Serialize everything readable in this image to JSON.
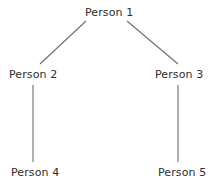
{
  "diagram": {
    "background_color": "#ffffff",
    "line_color": "#6e6e72",
    "text_color": "#2e2e2e",
    "nodes": [
      {
        "id": "person-1",
        "label": "Person 1"
      },
      {
        "id": "person-2",
        "label": "Person 2"
      },
      {
        "id": "person-3",
        "label": "Person 3"
      },
      {
        "id": "person-4",
        "label": "Person 4"
      },
      {
        "id": "person-5",
        "label": "Person 5"
      }
    ],
    "edges": [
      {
        "from": "person-1",
        "to": "person-2",
        "kind": "diagonal"
      },
      {
        "from": "person-1",
        "to": "person-3",
        "kind": "diagonal"
      },
      {
        "from": "person-2",
        "to": "person-4",
        "kind": "vertical"
      },
      {
        "from": "person-3",
        "to": "person-5",
        "kind": "vertical"
      }
    ]
  }
}
